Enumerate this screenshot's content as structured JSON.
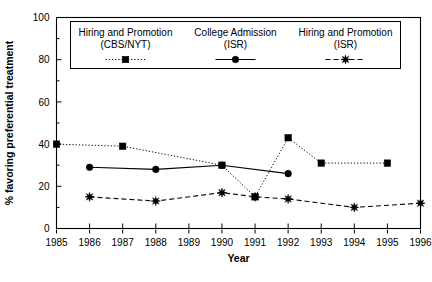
{
  "chart_data": {
    "type": "line",
    "title": "",
    "xlabel": "Year",
    "ylabel": "% favoring preferential treatment",
    "xlim": [
      1985,
      1996
    ],
    "ylim": [
      0,
      100
    ],
    "grid": false,
    "legend_position": "top-inside",
    "x_ticks": [
      "1985",
      "1986",
      "1987",
      "1988",
      "1989",
      "1990",
      "1991",
      "1992",
      "1993",
      "1994",
      "1995",
      "1996"
    ],
    "y_ticks": [
      "0",
      "20",
      "40",
      "60",
      "80",
      "100"
    ],
    "y_minor_ticks": [
      10,
      30,
      50,
      70,
      90
    ],
    "series": [
      {
        "name": "Hiring and Promotion (CBS/NYT)",
        "name_line1": "Hiring and Promotion",
        "name_line2": "(CBS/NYT)",
        "marker": "square",
        "linestyle": "dotted",
        "color": "#000000",
        "points": [
          {
            "x": 1985,
            "y": 40
          },
          {
            "x": 1987,
            "y": 39
          },
          {
            "x": 1990,
            "y": 30
          },
          {
            "x": 1991,
            "y": 15
          },
          {
            "x": 1992,
            "y": 43
          },
          {
            "x": 1993,
            "y": 31
          },
          {
            "x": 1995,
            "y": 31
          }
        ]
      },
      {
        "name": "College Admission (ISR)",
        "name_line1": "College Admission",
        "name_line2": "(ISR)",
        "marker": "circle",
        "linestyle": "solid",
        "color": "#000000",
        "points": [
          {
            "x": 1986,
            "y": 29
          },
          {
            "x": 1988,
            "y": 28
          },
          {
            "x": 1990,
            "y": 30
          },
          {
            "x": 1992,
            "y": 26
          }
        ]
      },
      {
        "name": "Hiring and Promotion (ISR)",
        "name_line1": "Hiring and Promotion",
        "name_line2": "(ISR)",
        "marker": "star",
        "linestyle": "dashed",
        "color": "#000000",
        "points": [
          {
            "x": 1986,
            "y": 15
          },
          {
            "x": 1988,
            "y": 13
          },
          {
            "x": 1990,
            "y": 17
          },
          {
            "x": 1991,
            "y": 15
          },
          {
            "x": 1992,
            "y": 14
          },
          {
            "x": 1994,
            "y": 10
          },
          {
            "x": 1996,
            "y": 12
          }
        ]
      }
    ]
  }
}
